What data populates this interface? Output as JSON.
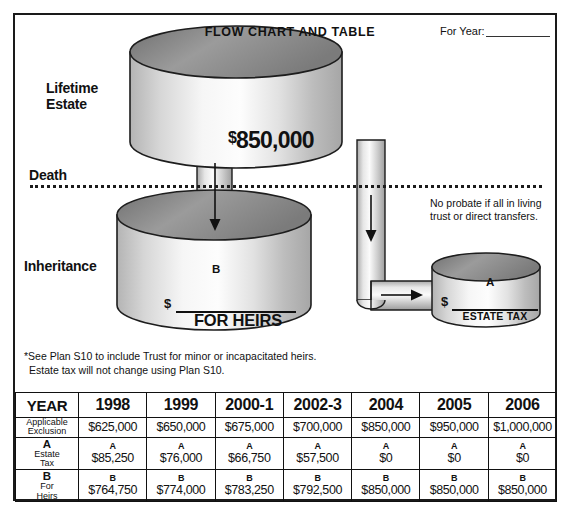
{
  "document": {
    "title": "FLOW CHART AND TABLE",
    "for_year_label": "For Year:",
    "for_year_value": ""
  },
  "diagram": {
    "labels": {
      "lifetime_estate": "Lifetime\nEstate",
      "death": "Death",
      "inheritance": "Inheritance"
    },
    "lifetime_amount_currency": "$",
    "lifetime_amount": "850,000",
    "heirs_cylinder": {
      "letter": "B",
      "dollar": "$",
      "caption": "FOR HEIRS"
    },
    "estate_tax_cylinder": {
      "letter": "A",
      "dollar": "$",
      "caption": "ESTATE TAX"
    },
    "probate_note": "No probate if all in living trust or direct transfers.",
    "icons": {
      "down_arrow": "down-arrow-icon",
      "right_arrow": "right-arrow-icon"
    }
  },
  "footnote": {
    "line1": "*See Plan S10 to include Trust for minor or incapacitated heirs.",
    "line2": "Estate tax will not change using Plan S10."
  },
  "table": {
    "header": [
      "YEAR",
      "1998",
      "1999",
      "2000-1",
      "2002-3",
      "2004",
      "2005",
      "2006"
    ],
    "rows": [
      {
        "label_big": "",
        "label_lines": [
          "Applicable",
          "Exclusion"
        ],
        "tag": "",
        "values": [
          "$625,000",
          "$650,000",
          "$675,000",
          "$700,000",
          "$850,000",
          "$950,000",
          "$1,000,000"
        ]
      },
      {
        "label_big": "A",
        "label_lines": [
          "Estate",
          "Tax"
        ],
        "tag": "A",
        "values": [
          "$85,250",
          "$76,000",
          "$66,750",
          "$57,500",
          "$0",
          "$0",
          "$0"
        ]
      },
      {
        "label_big": "B",
        "label_lines": [
          "For",
          "Heirs"
        ],
        "tag": "B",
        "values": [
          "$764,750",
          "$774,000",
          "$783,250",
          "$792,500",
          "$850,000",
          "$850,000",
          "$850,000"
        ]
      }
    ]
  },
  "colors": {
    "ink": "#111111",
    "cylinder_top": "#8d8d8d",
    "cylinder_body_light": "#f2f2f2",
    "cylinder_body_mid": "#c9c9c9",
    "background": "#ffffff"
  }
}
